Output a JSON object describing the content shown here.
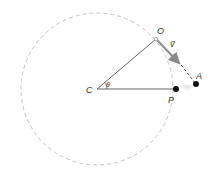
{
  "caption": "",
  "diagram": {
    "type": "circular-motion",
    "circle": {
      "cx": 97,
      "cy": 89,
      "r": 76,
      "stroke": "#bdbdbd",
      "style": "dashed"
    },
    "points": {
      "C": {
        "x": 97,
        "y": 89,
        "label": "C"
      },
      "O": {
        "x": 156,
        "y": 39,
        "label": "O"
      },
      "P": {
        "x": 176,
        "y": 89,
        "label": "P"
      },
      "A": {
        "x": 196,
        "y": 84,
        "label": "A"
      }
    },
    "angle_label": "θ",
    "velocity_label": "v⃗",
    "colors": {
      "radius_line": "#555555",
      "vector": "#8a8a8a",
      "tangent_dash": "#555555",
      "dot": "#111111",
      "circle": "#bdbdbd"
    }
  }
}
